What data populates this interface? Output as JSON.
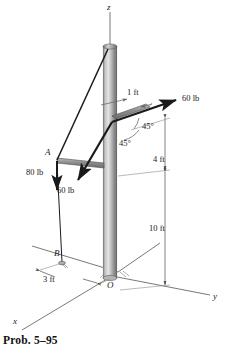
{
  "figure": {
    "caption": "Prob. 5–95",
    "axes": {
      "z_label": "z",
      "x_label": "x",
      "y_label": "y"
    },
    "points": {
      "A": "A",
      "B": "B",
      "O": "O"
    },
    "forces": [
      {
        "id": "force-60-upper",
        "label": "60 lb",
        "magnitude": 60,
        "unit": "lb"
      },
      {
        "id": "force-80-vertical",
        "label": "80 lb",
        "magnitude": 80,
        "unit": "lb"
      },
      {
        "id": "force-60-lower",
        "label": "60 lb",
        "magnitude": 60,
        "unit": "lb"
      }
    ],
    "dimensions": [
      {
        "id": "dim-1ft",
        "label": "1 ft",
        "value": 1,
        "unit": "ft"
      },
      {
        "id": "dim-4ft",
        "label": "4 ft",
        "value": 4,
        "unit": "ft"
      },
      {
        "id": "dim-10ft",
        "label": "10 ft",
        "value": 10,
        "unit": "ft"
      },
      {
        "id": "dim-3ft",
        "label": "3 ft",
        "value": 3,
        "unit": "ft"
      }
    ],
    "angles": [
      {
        "id": "angle-upper-45",
        "label": "45°",
        "value": 45
      },
      {
        "id": "angle-lower-45",
        "label": "45°",
        "value": 45
      }
    ],
    "colors": {
      "line": "#1a1a1a",
      "pole_light": "#d8d8d8",
      "pole_mid": "#9a9a9a",
      "pole_dark": "#6e6e6e",
      "thin": "#808080",
      "background": "#ffffff"
    }
  }
}
